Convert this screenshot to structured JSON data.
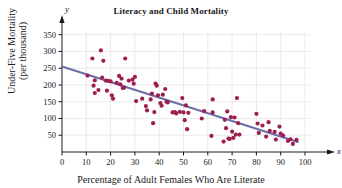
{
  "chart_data": {
    "type": "scatter",
    "title": "Literacy and Child Mortality",
    "xlabel": "Percentage of Adult Females Who Are Literate",
    "ylabel": "Under-Five Mortality\n(per thousand)",
    "ylabel_line1": "Under-Five Mortality",
    "ylabel_line2": "(per thousand)",
    "x_axis_name": "x",
    "y_axis_name": "y",
    "xlim": [
      0,
      100
    ],
    "ylim": [
      0,
      370
    ],
    "xticks": [
      0,
      10,
      20,
      30,
      40,
      50,
      60,
      70,
      80,
      90,
      100
    ],
    "yticks": [
      50,
      100,
      150,
      200,
      250,
      300,
      350
    ],
    "grid": true,
    "grid_x_step": 10,
    "grid_y_step": 50,
    "legend": null,
    "point_color": "#9E1F4F",
    "line_color": "#6B6FA8",
    "grid_color": "#E2E2E8",
    "axis_color": "#1a1a1a",
    "trendline": {
      "name": "least-squares regression line",
      "x0": 0,
      "y0": 255,
      "x1": 97,
      "y1": 30
    },
    "points": [
      [
        10.5,
        228
      ],
      [
        12.5,
        279
      ],
      [
        13.0,
        198
      ],
      [
        13.5,
        176
      ],
      [
        13.5,
        214
      ],
      [
        15.0,
        185
      ],
      [
        16.0,
        303
      ],
      [
        16.5,
        222
      ],
      [
        17.0,
        272
      ],
      [
        18.0,
        213
      ],
      [
        18.5,
        183
      ],
      [
        19.0,
        212
      ],
      [
        20.0,
        211
      ],
      [
        20.5,
        169
      ],
      [
        21.0,
        159
      ],
      [
        22.5,
        206
      ],
      [
        23.5,
        227
      ],
      [
        24.0,
        202
      ],
      [
        24.5,
        219
      ],
      [
        25.0,
        191
      ],
      [
        25.5,
        192
      ],
      [
        26.0,
        279
      ],
      [
        27.5,
        213
      ],
      [
        29.0,
        216
      ],
      [
        29.5,
        204
      ],
      [
        30.0,
        224
      ],
      [
        30.5,
        152
      ],
      [
        33.0,
        159
      ],
      [
        34.5,
        137
      ],
      [
        35.0,
        124
      ],
      [
        36.5,
        157
      ],
      [
        37.0,
        174
      ],
      [
        37.5,
        86
      ],
      [
        38.0,
        119
      ],
      [
        38.5,
        204
      ],
      [
        39.0,
        198
      ],
      [
        39.5,
        169
      ],
      [
        40.5,
        146
      ],
      [
        41.0,
        138
      ],
      [
        41.5,
        171
      ],
      [
        42.5,
        188
      ],
      [
        43.0,
        150
      ],
      [
        43.5,
        148
      ],
      [
        45.5,
        118
      ],
      [
        46.5,
        119
      ],
      [
        47.0,
        115
      ],
      [
        48.5,
        120
      ],
      [
        49.5,
        161
      ],
      [
        50.0,
        118
      ],
      [
        50.5,
        95
      ],
      [
        51.0,
        139
      ],
      [
        51.5,
        68
      ],
      [
        52.0,
        117
      ],
      [
        57.5,
        100
      ],
      [
        58.5,
        122
      ],
      [
        61.5,
        48
      ],
      [
        62.0,
        157
      ],
      [
        62.0,
        118
      ],
      [
        66.5,
        31
      ],
      [
        67.0,
        96
      ],
      [
        67.5,
        71
      ],
      [
        68.0,
        121
      ],
      [
        68.5,
        40
      ],
      [
        69.0,
        39
      ],
      [
        69.5,
        104
      ],
      [
        70.0,
        61
      ],
      [
        70.5,
        42
      ],
      [
        71.0,
        103
      ],
      [
        71.5,
        52
      ],
      [
        72.0,
        161
      ],
      [
        72.5,
        86
      ],
      [
        73.0,
        52
      ],
      [
        80.0,
        114
      ],
      [
        80.5,
        85
      ],
      [
        81.0,
        57
      ],
      [
        82.5,
        79
      ],
      [
        84.0,
        46
      ],
      [
        85.0,
        89
      ],
      [
        85.5,
        63
      ],
      [
        87.5,
        60
      ],
      [
        88.0,
        37
      ],
      [
        89.5,
        76
      ],
      [
        90.0,
        55
      ],
      [
        91.0,
        49
      ],
      [
        93.0,
        33
      ],
      [
        94.0,
        38
      ],
      [
        95.0,
        24
      ],
      [
        96.5,
        36
      ]
    ]
  }
}
